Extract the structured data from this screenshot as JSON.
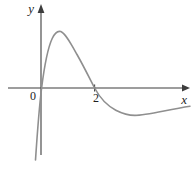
{
  "figure": {
    "bg_color": "#ffffff",
    "axis_color": "#3d3d3d",
    "curve_color": "#8f8f8f",
    "label_color": "#1f1f1f"
  },
  "labels": {
    "y_axis": "y",
    "x_axis": "x",
    "origin": "0",
    "x_tick_2": "2"
  },
  "geometry_px": {
    "x_axis_d": "M8,88 L183.5,88",
    "x_arrow_d": "M182,84.6 L190,88 L182,91.4 Z",
    "y_axis_d": "M41,11 L41,155",
    "y_arrow_d": "M37.6,13 L41,4 L44.4,13 Z",
    "tick_2_d": "M94.6,84.5 L94.6,91.5",
    "curve_d": "M35.5,160 C37.3,133 39.2,107 41.6,88 C44,69 46.8,50 52.2,38.5 C55,32.5 58,30.6 60.8,31.6 C65.5,33.5 70.5,43 77,54.5 C83,65 89.2,77.5 94.6,88 C99.8,97.8 107,105.5 115.8,110.2 C122.5,113.6 128.8,115.4 134.8,115.4 C146.5,115.4 166,110 190,106.2"
  },
  "chart_data": {
    "type": "line",
    "title": "",
    "xlabel": "x",
    "ylabel": "y",
    "x_tick_labels": [
      "0",
      "2"
    ],
    "x_intercepts": [
      0,
      2
    ],
    "local_max": {
      "x": 0.67,
      "y": 2.1
    },
    "local_min": {
      "x": 3.4,
      "y": -1.05
    },
    "x": [
      -0.2,
      -0.1,
      0,
      0.2,
      0.4,
      0.67,
      1,
      1.5,
      2,
      2.5,
      3,
      3.4,
      4,
      4.5,
      5,
      5.5
    ],
    "y": [
      -2.65,
      -1.4,
      0,
      1.1,
      1.8,
      2.1,
      1.95,
      1.15,
      0,
      -0.65,
      -0.97,
      -1.05,
      -1.0,
      -0.9,
      -0.78,
      -0.67
    ],
    "xlim": [
      -1.2,
      5.6
    ],
    "ylim": [
      -3.1,
      3.1
    ],
    "grid": false,
    "legend_position": "none"
  }
}
